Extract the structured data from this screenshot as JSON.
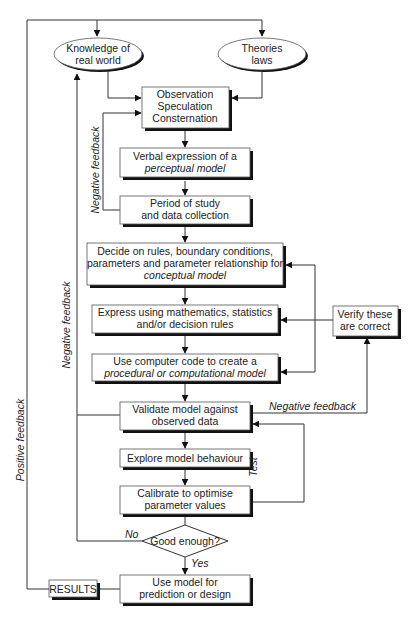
{
  "nodes": {
    "knowledge": {
      "lines": [
        "Knowledge of",
        "real world"
      ]
    },
    "theories": {
      "lines": [
        "Theories",
        "laws"
      ]
    },
    "observation": {
      "lines": [
        "Observation",
        "Speculation",
        "Consternation"
      ]
    },
    "verbal": {
      "line1": "Verbal expression of a",
      "line2_italic": "perceptual model"
    },
    "period": {
      "lines": [
        "Period of study",
        "and data collection"
      ]
    },
    "decide": {
      "line1": "Decide on rules, boundary conditions,",
      "line2": "parameters and parameter relationship for",
      "line3_italic": "conceptual model"
    },
    "express": {
      "lines": [
        "Express using mathematics, statistics",
        "and/or decision rules"
      ]
    },
    "code": {
      "line1": "Use computer code to create a",
      "line2_italic": "procedural or computational model"
    },
    "verify": {
      "lines": [
        "Verify these",
        "are correct"
      ]
    },
    "validate": {
      "lines": [
        "Validate model against",
        "observed data"
      ]
    },
    "explore": {
      "lines": [
        "Explore model behaviour"
      ]
    },
    "calibrate": {
      "lines": [
        "Calibrate to optimise",
        "parameter values"
      ]
    },
    "decision": {
      "label": "Good enough?"
    },
    "use": {
      "lines": [
        "Use model for",
        "prediction or design"
      ]
    },
    "results": {
      "label": "RESULTS"
    }
  },
  "edge_labels": {
    "negative_feedback_inner": "Negative feedback",
    "negative_feedback_outer": "Negative feedback",
    "negative_feedback_validate": "Negative feedback",
    "positive_feedback": "Positive feedback",
    "test": "Test",
    "no": "No",
    "yes": "Yes"
  }
}
